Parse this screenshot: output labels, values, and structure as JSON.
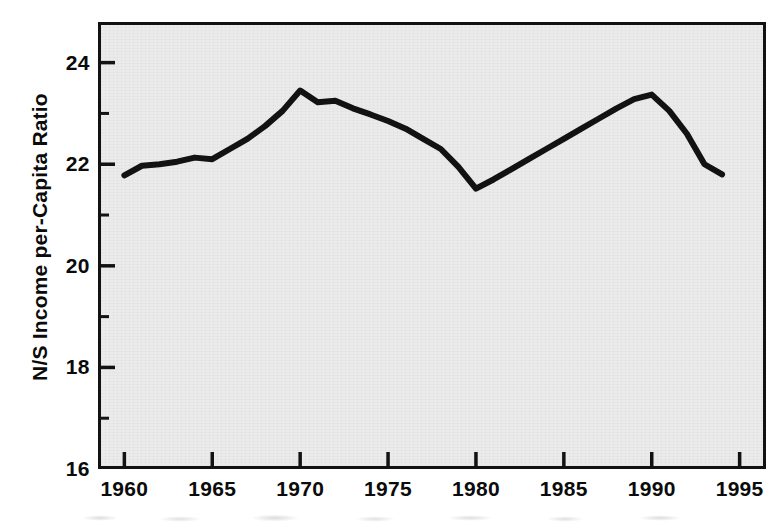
{
  "chart_data": {
    "type": "line",
    "title": "",
    "xlabel": "",
    "ylabel": "N/S Income per-Capita Ratio",
    "xlim": [
      1958.5,
      1996.5
    ],
    "ylim": [
      16,
      24.8
    ],
    "grid": false,
    "legend": null,
    "xticks": [
      1960,
      1965,
      1970,
      1975,
      1980,
      1985,
      1990,
      1995
    ],
    "xtick_labels": [
      "1960",
      "1965",
      "1970",
      "1975",
      "1980",
      "1985",
      "1990",
      "1995"
    ],
    "xticks_minor": [],
    "yticks": [
      16,
      18,
      20,
      22,
      24
    ],
    "ytick_labels": [
      "16",
      "18",
      "20",
      "22",
      "24"
    ],
    "yticks_minor": [
      17,
      19,
      21,
      23
    ],
    "series": [
      {
        "name": "N/S Income per-Capita Ratio",
        "color": "#121212",
        "x": [
          1960,
          1961,
          1962,
          1963,
          1964,
          1965,
          1966,
          1967,
          1968,
          1969,
          1970,
          1971,
          1972,
          1973,
          1974,
          1975,
          1976,
          1977,
          1978,
          1979,
          1980,
          1981,
          1982,
          1983,
          1984,
          1985,
          1986,
          1987,
          1988,
          1989,
          1990,
          1991,
          1992,
          1993,
          1994
        ],
        "values": [
          21.78,
          21.97,
          22.0,
          22.05,
          22.13,
          22.1,
          22.3,
          22.5,
          22.75,
          23.05,
          23.45,
          23.22,
          23.25,
          23.1,
          22.98,
          22.85,
          22.7,
          22.5,
          22.3,
          21.95,
          21.52,
          21.7,
          21.9,
          22.1,
          22.3,
          22.5,
          22.7,
          22.9,
          23.1,
          23.28,
          23.37,
          23.05,
          22.6,
          22.0,
          21.8
        ]
      }
    ]
  },
  "axes": {
    "y_title": "N/S Income per-Capita Ratio"
  }
}
